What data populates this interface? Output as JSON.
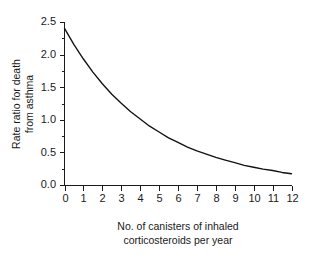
{
  "chart_data": {
    "type": "line",
    "title": "",
    "subtitle": "",
    "xlabel_line1": "No. of canisters of inhaled",
    "xlabel_line2": "corticosteroids per year",
    "ylabel_line1": "Rate ratio for death",
    "ylabel_line2": "from asthma",
    "xlim": [
      0,
      12
    ],
    "ylim": [
      0.0,
      2.5
    ],
    "grid": false,
    "legend": null,
    "x_ticks": [
      0,
      1,
      2,
      3,
      4,
      5,
      6,
      7,
      8,
      9,
      10,
      11,
      12
    ],
    "x_tick_labels": [
      "0",
      "1",
      "2",
      "3",
      "4",
      "5",
      "6",
      "7",
      "8",
      "9",
      "10",
      "11",
      "12"
    ],
    "y_ticks": [
      0.0,
      0.5,
      1.0,
      1.5,
      2.0,
      2.5
    ],
    "y_tick_labels": [
      "0.0",
      "0.5",
      "1.0",
      "1.5",
      "2.0",
      "2.5"
    ],
    "y_minor_ticks": [
      0.25,
      0.75,
      1.25,
      1.75,
      2.25
    ],
    "series": [
      {
        "name": "Rate ratio for death from asthma",
        "color": "#111111",
        "x": [
          0,
          0.5,
          1,
          1.5,
          2,
          2.5,
          3,
          3.5,
          4,
          4.5,
          5,
          5.5,
          6,
          6.5,
          7,
          7.5,
          8,
          8.5,
          9,
          9.5,
          10,
          10.5,
          11,
          11.5,
          12
        ],
        "values": [
          2.41,
          2.16,
          1.94,
          1.74,
          1.56,
          1.4,
          1.26,
          1.13,
          1.02,
          0.91,
          0.82,
          0.73,
          0.66,
          0.59,
          0.53,
          0.48,
          0.43,
          0.39,
          0.35,
          0.31,
          0.28,
          0.25,
          0.23,
          0.2,
          0.18
        ]
      }
    ]
  },
  "axis": {
    "y_labels": [
      "2.5",
      "2.0",
      "1.5",
      "1.0",
      "0.5",
      "0.0"
    ],
    "x_labels": [
      "0",
      "1",
      "2",
      "3",
      "4",
      "5",
      "6",
      "7",
      "8",
      "9",
      "10",
      "11",
      "12"
    ]
  }
}
